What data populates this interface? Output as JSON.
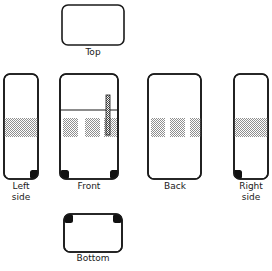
{
  "diagram": {
    "stroke_color": "#1a1a1a",
    "fill_color": "#ffffff",
    "hatch_color": "#9a9a9a",
    "foot_color": "#111111",
    "views": [
      {
        "id": "top",
        "label": "Top",
        "x": 62,
        "y": 5,
        "w": 62,
        "h": 40,
        "radius": 6,
        "label_x": 62,
        "label_y": 47,
        "label_w": 62,
        "bands": [],
        "patches": [],
        "feet": [],
        "divider": null,
        "handle": null
      },
      {
        "id": "left-side",
        "label": "Left\nside",
        "x": 4,
        "y": 74,
        "w": 34,
        "h": 105,
        "radius": 6,
        "label_x": 4,
        "label_y": 181,
        "label_w": 34,
        "bands": [
          {
            "y": 118,
            "h": 19
          }
        ],
        "patches": [],
        "feet": [
          {
            "corner": "bottom-right"
          }
        ],
        "divider": null,
        "handle": null
      },
      {
        "id": "front",
        "label": "Front",
        "x": 60,
        "y": 74,
        "w": 58,
        "h": 105,
        "radius": 6,
        "label_x": 56,
        "label_y": 181,
        "label_w": 66,
        "bands": [],
        "patches": [
          {
            "x": 63,
            "y": 118,
            "w": 15,
            "h": 19
          },
          {
            "x": 85,
            "y": 118,
            "w": 15,
            "h": 19
          },
          {
            "x": 104,
            "y": 118,
            "w": 13,
            "h": 19
          }
        ],
        "feet": [
          {
            "corner": "bottom-left"
          },
          {
            "corner": "bottom-right"
          }
        ],
        "divider": {
          "y": 110
        },
        "handle": {
          "x": 106,
          "y": 95,
          "w": 4,
          "h": 40
        }
      },
      {
        "id": "back",
        "label": "Back",
        "x": 148,
        "y": 74,
        "w": 53,
        "h": 105,
        "radius": 6,
        "label_x": 145,
        "label_y": 181,
        "label_w": 60,
        "bands": [],
        "patches": [
          {
            "x": 151,
            "y": 118,
            "w": 14,
            "h": 19
          },
          {
            "x": 170,
            "y": 118,
            "w": 15,
            "h": 19
          },
          {
            "x": 190,
            "y": 118,
            "w": 11,
            "h": 19
          }
        ],
        "feet": [],
        "divider": null,
        "handle": null
      },
      {
        "id": "right-side",
        "label": "Right\nside",
        "x": 234,
        "y": 74,
        "w": 34,
        "h": 105,
        "radius": 6,
        "label_x": 234,
        "label_y": 181,
        "label_w": 34,
        "bands": [
          {
            "y": 118,
            "h": 19
          }
        ],
        "patches": [],
        "feet": [
          {
            "corner": "bottom-left"
          }
        ],
        "divider": null,
        "handle": null
      },
      {
        "id": "bottom",
        "label": "Bottom",
        "x": 64,
        "y": 214,
        "w": 58,
        "h": 38,
        "radius": 6,
        "label_x": 60,
        "label_y": 253,
        "label_w": 66,
        "bands": [],
        "patches": [],
        "feet": [
          {
            "corner": "top-left"
          },
          {
            "corner": "top-right"
          }
        ],
        "divider": null,
        "handle": null
      }
    ]
  }
}
